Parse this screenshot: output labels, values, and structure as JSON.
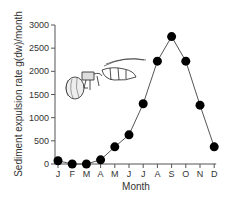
{
  "chart_data": {
    "type": "line",
    "title": "",
    "xlabel": "Month",
    "ylabel": "Sediment expulsion rate g(dw)/month",
    "categories": [
      "J",
      "F",
      "M",
      "A",
      "M",
      "J",
      "J",
      "A",
      "S",
      "O",
      "N",
      "D"
    ],
    "series": [
      {
        "name": "Sediment expulsion rate",
        "values": [
          70,
          0,
          0,
          90,
          370,
          630,
          1300,
          2220,
          2750,
          2220,
          1270,
          370
        ]
      }
    ],
    "ylim": [
      0,
      3000
    ],
    "yticks": [
      0,
      500,
      1000,
      1500,
      2000,
      2500,
      3000
    ],
    "grid": false,
    "legend": "none",
    "marker": "filled-circle",
    "line_color": "#555555",
    "marker_color": "#000000",
    "annotation": "insect-illustration"
  }
}
